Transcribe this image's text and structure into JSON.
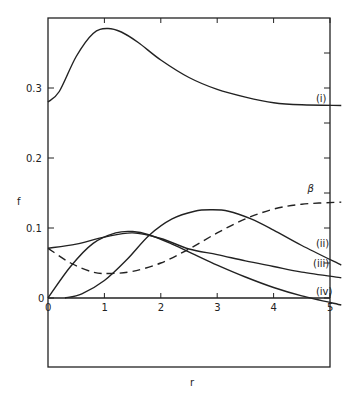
{
  "chart_data": {
    "type": "line",
    "title": "",
    "xlabel": "r",
    "ylabel": "f",
    "xlim": [
      0,
      5.2
    ],
    "ylim": [
      -0.1,
      0.4
    ],
    "grid": false,
    "x_ticks": [
      "0",
      "1",
      "2",
      "3",
      "4",
      "5"
    ],
    "y_ticks": [
      "0",
      "0.1",
      "0.2",
      "0.3"
    ],
    "series": [
      {
        "name": "(i)",
        "style": "solid",
        "x": [
          0,
          0.2,
          0.5,
          0.8,
          1.05,
          1.3,
          1.6,
          2.0,
          2.5,
          3.0,
          3.5,
          4.0,
          4.5,
          5.2
        ],
        "y": [
          0.28,
          0.295,
          0.345,
          0.378,
          0.385,
          0.38,
          0.365,
          0.34,
          0.315,
          0.298,
          0.287,
          0.279,
          0.276,
          0.275
        ]
      },
      {
        "name": "(ii)",
        "style": "solid",
        "x": [
          0.3,
          0.6,
          1.0,
          1.4,
          1.8,
          2.2,
          2.6,
          2.9,
          3.2,
          3.6,
          4.0,
          4.5,
          5.2
        ],
        "y": [
          0.0,
          0.006,
          0.025,
          0.055,
          0.09,
          0.113,
          0.124,
          0.126,
          0.124,
          0.113,
          0.097,
          0.075,
          0.047
        ]
      },
      {
        "name": "(iii)",
        "style": "solid",
        "x": [
          0,
          0.5,
          1.0,
          1.5,
          2.0,
          2.5,
          3.0,
          3.5,
          4.0,
          4.5,
          5.2
        ],
        "y": [
          0.071,
          0.077,
          0.087,
          0.093,
          0.085,
          0.07,
          0.062,
          0.053,
          0.045,
          0.037,
          0.029
        ]
      },
      {
        "name": "(iv)",
        "style": "solid",
        "x": [
          0,
          0.4,
          0.8,
          1.2,
          1.5,
          1.8,
          2.2,
          2.6,
          3.0,
          3.5,
          4.0,
          4.5,
          5.2
        ],
        "y": [
          0.0,
          0.045,
          0.078,
          0.093,
          0.095,
          0.09,
          0.077,
          0.062,
          0.047,
          0.03,
          0.015,
          0.003,
          -0.01
        ]
      },
      {
        "name": "β",
        "style": "dashed",
        "x": [
          0,
          0.4,
          0.8,
          1.1,
          1.5,
          2.0,
          2.5,
          3.0,
          3.5,
          4.0,
          4.5,
          5.2
        ],
        "y": [
          0.071,
          0.05,
          0.037,
          0.035,
          0.038,
          0.05,
          0.07,
          0.093,
          0.113,
          0.127,
          0.134,
          0.137
        ]
      }
    ],
    "annotations": [
      {
        "text": "(i)",
        "x": 4.75,
        "y": 0.28
      },
      {
        "text": "(ii)",
        "x": 4.75,
        "y": 0.073
      },
      {
        "text": "(iii)",
        "x": 4.7,
        "y": 0.044
      },
      {
        "text": "(iv)",
        "x": 4.75,
        "y": 0.005
      },
      {
        "text": "β",
        "x": 4.6,
        "y": 0.152
      }
    ]
  }
}
